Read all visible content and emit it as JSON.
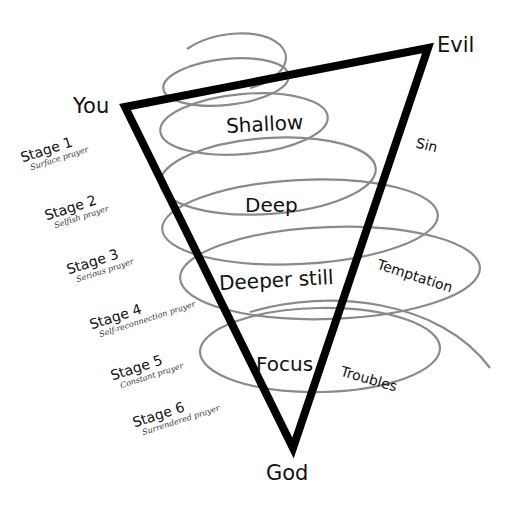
{
  "diagram": {
    "type": "inverted-triangle-spiral",
    "colors": {
      "triangle": "#000000",
      "spiral": "#8a8a8a",
      "text": "#111111",
      "background": "#ffffff"
    },
    "vertices": {
      "top_left": "You",
      "top_right": "Evil",
      "bottom": "God"
    },
    "levels": [
      "Shallow",
      "Deep",
      "Deeper still",
      "Focus"
    ],
    "forces": [
      "Sin",
      "Temptation",
      "Troubles"
    ],
    "stages": [
      {
        "title": "Stage 1",
        "subtitle": "Surface prayer"
      },
      {
        "title": "Stage 2",
        "subtitle": "Selfish prayer"
      },
      {
        "title": "Stage 3",
        "subtitle": "Serious prayer"
      },
      {
        "title": "Stage 4",
        "subtitle": "Self-reconnection prayer"
      },
      {
        "title": "Stage 5",
        "subtitle": "Constant prayer"
      },
      {
        "title": "Stage 6",
        "subtitle": "Surrendered prayer"
      }
    ]
  }
}
